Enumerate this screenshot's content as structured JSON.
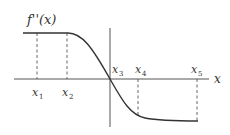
{
  "figure": {
    "function_label": "f''(x)",
    "axis_label": "x",
    "colors": {
      "ink": "#333333",
      "axis": "#555555",
      "dash": "#666666",
      "background": "#ffffff"
    },
    "points": [
      {
        "name": "x",
        "sub": "1"
      },
      {
        "name": "x",
        "sub": "2"
      },
      {
        "name": "x",
        "sub": "3"
      },
      {
        "name": "x",
        "sub": "4"
      },
      {
        "name": "x",
        "sub": "5"
      }
    ]
  }
}
